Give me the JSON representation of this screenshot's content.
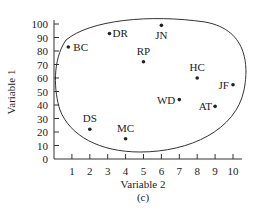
{
  "chart_data": {
    "type": "scatter",
    "title": "",
    "caption": "(c)",
    "xlabel": "Variable 2",
    "ylabel": "Variable 1",
    "xlim": [
      0,
      10.5
    ],
    "ylim": [
      0,
      100
    ],
    "x_ticks": [
      1,
      2,
      3,
      4,
      5,
      6,
      7,
      8,
      9,
      10
    ],
    "y_ticks": [
      0,
      10,
      20,
      30,
      40,
      50,
      60,
      70,
      80,
      90,
      100
    ],
    "grid": false,
    "legend": null,
    "points": [
      {
        "label": "BC",
        "x": 0.8,
        "y": 83
      },
      {
        "label": "DR",
        "x": 3.1,
        "y": 93
      },
      {
        "label": "JN",
        "x": 6.0,
        "y": 99
      },
      {
        "label": "RP",
        "x": 5.0,
        "y": 72
      },
      {
        "label": "HC",
        "x": 8.0,
        "y": 60
      },
      {
        "label": "JF",
        "x": 10.0,
        "y": 55
      },
      {
        "label": "WD",
        "x": 7.0,
        "y": 44
      },
      {
        "label": "AT",
        "x": 9.0,
        "y": 39
      },
      {
        "label": "DS",
        "x": 2.0,
        "y": 22
      },
      {
        "label": "MC",
        "x": 4.0,
        "y": 15
      }
    ],
    "annotations": [
      "Closed curve enclosing all points"
    ]
  }
}
